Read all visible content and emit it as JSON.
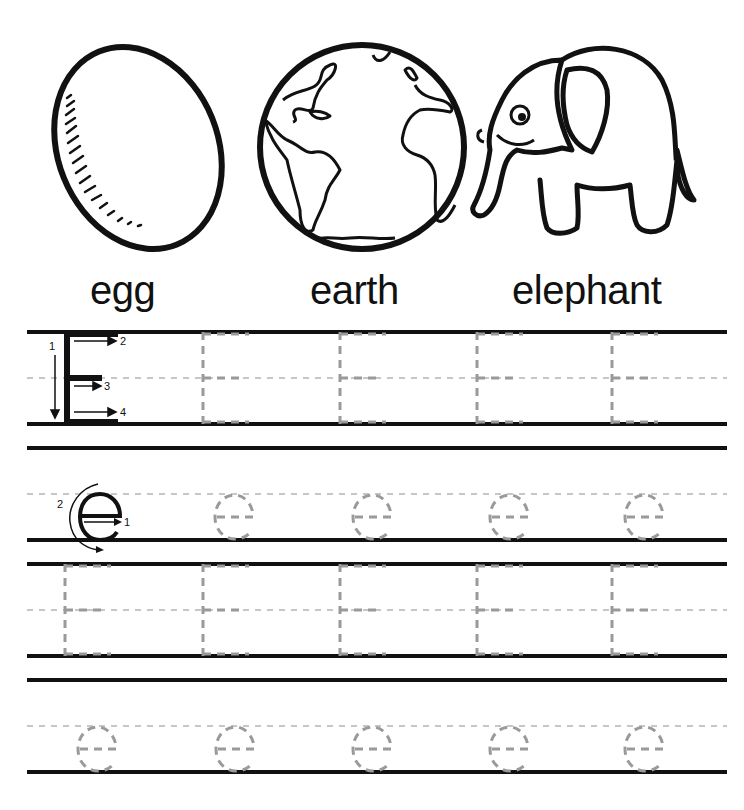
{
  "worksheet": {
    "letter_upper": "E",
    "letter_lower": "e",
    "pictures": [
      {
        "name": "egg",
        "label": "egg"
      },
      {
        "name": "earth",
        "label": "earth"
      },
      {
        "name": "elephant",
        "label": "elephant"
      }
    ],
    "uppercase_stroke_numbers": [
      "1",
      "2",
      "3",
      "4"
    ],
    "lowercase_stroke_numbers": [
      "1",
      "2"
    ],
    "trace_rows": [
      {
        "type": "uppercase",
        "model": "E",
        "trace_count": 4
      },
      {
        "type": "lowercase",
        "model": "e",
        "trace_count": 4
      },
      {
        "type": "uppercase",
        "model": "",
        "trace_count": 5
      },
      {
        "type": "lowercase",
        "model": "",
        "trace_count": 5
      }
    ],
    "colors": {
      "ink": "#111111",
      "trace": "#9a9a9a",
      "guide": "#b5b5b5"
    }
  }
}
